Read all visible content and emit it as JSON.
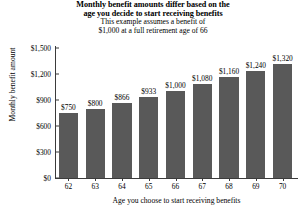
{
  "chart_data": {
    "type": "bar",
    "title": "Monthly benefit amounts differ based on the age you decide to start receiving benefits",
    "title_lines": [
      "Monthly benefit amounts differ based on the",
      "age you decide to start receiving benefits"
    ],
    "subtitle_lines": [
      "This example assumes a benefit of",
      "$1,000 at a full retirement age of 66"
    ],
    "xlabel": "Age you choose to start receiving benefits",
    "ylabel": "Monthly benefit amount",
    "categories": [
      "62",
      "63",
      "64",
      "65",
      "66",
      "67",
      "68",
      "69",
      "70"
    ],
    "values": [
      750,
      800,
      866,
      933,
      1000,
      1080,
      1160,
      1240,
      1320
    ],
    "value_labels": [
      "$750",
      "$800",
      "$866",
      "$933",
      "$1,000",
      "$1,080",
      "$1,160",
      "$1,240",
      "$1,320"
    ],
    "ylim": [
      0,
      1500
    ],
    "yticks": [
      0,
      300,
      600,
      900,
      1200,
      1500
    ],
    "ytick_labels": [
      "$0",
      "$300",
      "$600",
      "$900",
      "$1,200",
      "$1,500"
    ],
    "grid": false,
    "legend": false,
    "bar_color": "#595959",
    "axis_color": "#3b3b3b",
    "text_color": "#000000",
    "background": "#ffffff"
  }
}
